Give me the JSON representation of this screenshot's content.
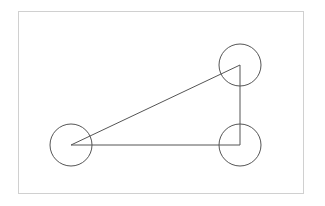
{
  "diagram": {
    "frame": {
      "x": 18,
      "y": 11,
      "width": 285,
      "height": 182,
      "stroke": "#d0d0d0"
    },
    "stroke_color": "#555555",
    "nodes": [
      {
        "id": "node-left",
        "cx": 71,
        "cy": 145,
        "r": 21
      },
      {
        "id": "node-top-right",
        "cx": 240,
        "cy": 65,
        "r": 21
      },
      {
        "id": "node-bottom-right",
        "cx": 240,
        "cy": 145,
        "r": 21
      }
    ],
    "edges": [
      {
        "from": "node-left",
        "to": "node-top-right"
      },
      {
        "from": "node-top-right",
        "to": "node-bottom-right"
      },
      {
        "from": "node-bottom-right",
        "to": "node-left"
      }
    ]
  }
}
